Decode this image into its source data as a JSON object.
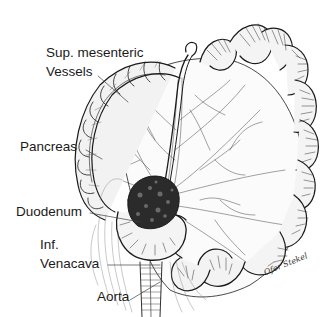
{
  "figure": {
    "colors": {
      "ink": "#1a1a1a",
      "background": "#ffffff",
      "shade": "#555555"
    }
  },
  "labels": {
    "sup_mesenteric_line1": "Sup. mesenteric",
    "sup_mesenteric_line2": "Vessels",
    "pancreas": "Pancreas",
    "duodenum": "Duodenum",
    "inf_venacava_line1": "Inf.",
    "inf_venacava_line2": "Venacava",
    "aorta": "Aorta"
  },
  "signature": "Ofer Stekel"
}
